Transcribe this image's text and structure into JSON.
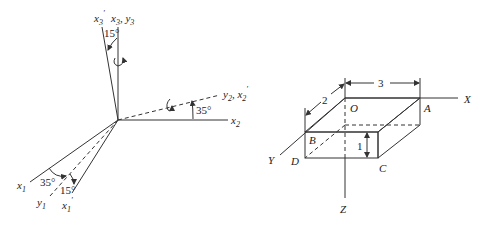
{
  "left_diagram": {
    "axes": {
      "x3_prime": {
        "base": "x",
        "sub": "3",
        "prime": true
      },
      "x3_y3": {
        "base1": "x",
        "sub1": "3",
        "sep": ", ",
        "base2": "y",
        "sub2": "3"
      },
      "y2_x2_prime": {
        "base1": "y",
        "sub1": "2",
        "sep": ", ",
        "base2": "x",
        "sub2": "2",
        "prime2": true
      },
      "x2": {
        "base": "x",
        "sub": "2"
      },
      "x1": {
        "base": "x",
        "sub": "1"
      },
      "y1": {
        "base": "y",
        "sub": "1"
      },
      "x1_prime": {
        "base": "x",
        "sub": "1",
        "prime": true
      }
    },
    "angles": {
      "top": "15°",
      "right": "35°",
      "bottom_left": "35°",
      "bottom_right": "15°"
    }
  },
  "right_diagram": {
    "axes": {
      "x": "X",
      "y": "Y",
      "z": "Z"
    },
    "vertices": {
      "o": "O",
      "a": "A",
      "b": "B",
      "c": "C",
      "d": "D"
    },
    "dimensions": {
      "length": "3",
      "width": "2",
      "height": "1"
    }
  }
}
